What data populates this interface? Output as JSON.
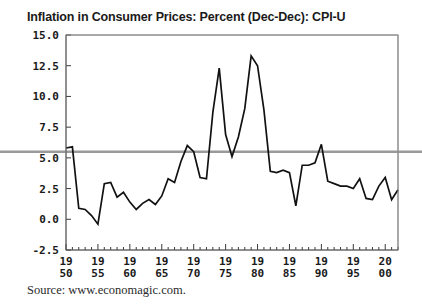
{
  "title": "Inflation in Consumer Prices: Percent (Dec-Dec): CPI-U",
  "source": "Source: www.economagic.com.",
  "chart_data": {
    "type": "line",
    "title": "Inflation in Consumer Prices: Percent (Dec-Dec): CPI-U",
    "xlabel": "",
    "ylabel": "",
    "xlim": [
      1950,
      2002
    ],
    "ylim": [
      -2.5,
      15.0
    ],
    "ytick_labels": [
      "15.0",
      "12.5",
      "10.0",
      "7.5",
      "5.0",
      "2.5",
      "0.0",
      "-2.5"
    ],
    "ytick_values": [
      15.0,
      12.5,
      10.0,
      7.5,
      5.0,
      2.5,
      0.0,
      -2.5
    ],
    "xtick_labels": [
      {
        "top": "19",
        "bottom": "50",
        "value": 1950
      },
      {
        "top": "19",
        "bottom": "55",
        "value": 1955
      },
      {
        "top": "19",
        "bottom": "60",
        "value": 1960
      },
      {
        "top": "19",
        "bottom": "65",
        "value": 1965
      },
      {
        "top": "19",
        "bottom": "70",
        "value": 1970
      },
      {
        "top": "19",
        "bottom": "75",
        "value": 1975
      },
      {
        "top": "19",
        "bottom": "80",
        "value": 1980
      },
      {
        "top": "19",
        "bottom": "85",
        "value": 1985
      },
      {
        "top": "19",
        "bottom": "90",
        "value": 1990
      },
      {
        "top": "19",
        "bottom": "95",
        "value": 1995
      },
      {
        "top": "20",
        "bottom": "00",
        "value": 2000
      }
    ],
    "minor_xticks_every": 1,
    "major_xticks_every": 5,
    "grid": false,
    "legend": null,
    "line_color": "#111111",
    "reference_line": {
      "name": "average-inflation-line",
      "value": 5.5,
      "color": "#9a9a9a",
      "extends_beyond_axes": true
    },
    "x": [
      1950,
      1951,
      1952,
      1953,
      1954,
      1955,
      1956,
      1957,
      1958,
      1959,
      1960,
      1961,
      1962,
      1963,
      1964,
      1965,
      1966,
      1967,
      1968,
      1969,
      1970,
      1971,
      1972,
      1973,
      1974,
      1975,
      1976,
      1977,
      1978,
      1979,
      1980,
      1981,
      1982,
      1983,
      1984,
      1985,
      1986,
      1987,
      1988,
      1989,
      1990,
      1991,
      1992,
      1993,
      1994,
      1995,
      1996,
      1997,
      1998,
      1999,
      2000,
      2001,
      2002
    ],
    "values": [
      5.8,
      5.9,
      0.9,
      0.8,
      0.3,
      -0.4,
      2.9,
      3.0,
      1.8,
      2.2,
      1.4,
      0.8,
      1.3,
      1.6,
      1.2,
      1.9,
      3.3,
      3.0,
      4.7,
      6.0,
      5.5,
      3.4,
      3.3,
      8.7,
      12.3,
      6.9,
      5.1,
      6.7,
      9.0,
      13.3,
      12.5,
      8.9,
      3.9,
      3.8,
      4.0,
      3.8,
      1.1,
      4.4,
      4.4,
      4.6,
      6.1,
      3.1,
      2.9,
      2.7,
      2.7,
      2.5,
      3.3,
      1.7,
      1.6,
      2.7,
      3.4,
      1.6,
      2.4
    ],
    "series": [
      {
        "name": "CPI-U December-to-December percent change",
        "values": [
          5.8,
          5.9,
          0.9,
          0.8,
          0.3,
          -0.4,
          2.9,
          3.0,
          1.8,
          2.2,
          1.4,
          0.8,
          1.3,
          1.6,
          1.2,
          1.9,
          3.3,
          3.0,
          4.7,
          6.0,
          5.5,
          3.4,
          3.3,
          8.7,
          12.3,
          6.9,
          5.1,
          6.7,
          9.0,
          13.3,
          12.5,
          8.9,
          3.9,
          3.8,
          4.0,
          3.8,
          1.1,
          4.4,
          4.4,
          4.6,
          6.1,
          3.1,
          2.9,
          2.7,
          2.7,
          2.5,
          3.3,
          1.7,
          1.6,
          2.7,
          3.4,
          1.6,
          2.4
        ]
      }
    ]
  }
}
